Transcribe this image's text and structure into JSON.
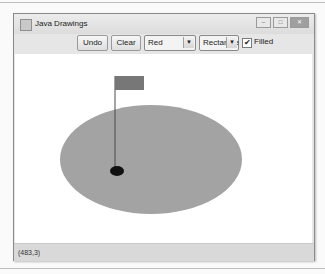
{
  "window": {
    "title": "Java Drawings",
    "controls": {
      "minimize": "–",
      "maximize": "□",
      "close": "✕"
    }
  },
  "toolbar": {
    "undo_label": "Undo",
    "clear_label": "Clear",
    "color_select": {
      "value": "Red"
    },
    "shape_select": {
      "value": "Rectangle"
    },
    "filled": {
      "label": "Filled",
      "checked": true,
      "mark": "✔"
    },
    "arrow_glyph": "▼"
  },
  "canvas": {
    "shapes": [
      {
        "type": "oval",
        "filled": true,
        "color": "#a3a3a3",
        "x": 59,
        "y": 105,
        "w": 182,
        "h": 109
      },
      {
        "type": "line",
        "color": "#4a4a4a",
        "x1": 114,
        "y1": 76,
        "x2": 114,
        "y2": 171
      },
      {
        "type": "rectangle",
        "filled": true,
        "color": "#777777",
        "x": 114,
        "y": 76,
        "w": 29,
        "h": 14
      },
      {
        "type": "oval",
        "filled": true,
        "color": "#111111",
        "x": 109,
        "y": 166,
        "w": 14,
        "h": 10
      }
    ]
  },
  "status": {
    "coordinates": "(483,3)"
  }
}
